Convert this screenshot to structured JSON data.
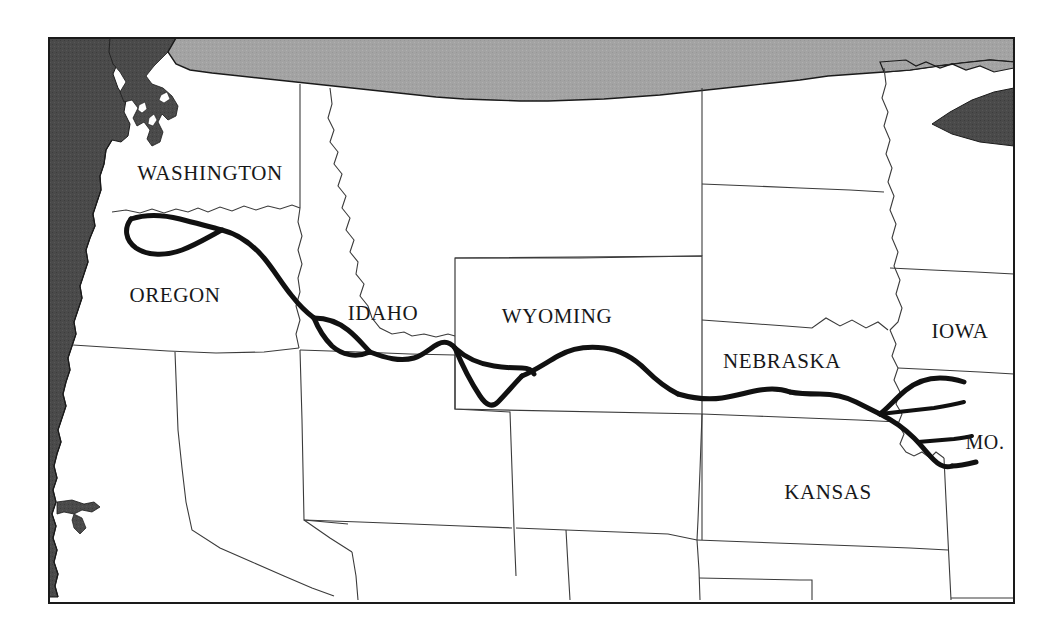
{
  "figure": {
    "kind": "reference-map",
    "background_color": "#ffffff",
    "frame": {
      "border_color": "#1a1a1a",
      "border_width_px": 2,
      "x": 48,
      "y": 37,
      "width": 967,
      "height": 567
    }
  },
  "colors": {
    "land_fill": "#ffffff",
    "ocean_fill": "#4a4a4a",
    "lake_fill": "#4a4a4a",
    "canada_fill": "#a3a3a3",
    "state_border": "#3b3b3b",
    "coastline": "#1a1a1a",
    "trail_stroke": "#111111",
    "label_text": "#17181a"
  },
  "legend_present": false,
  "scale_bar_present": false,
  "compass_present": false,
  "state_labels": [
    {
      "id": "washington",
      "text": "WASHINGTON",
      "x": 210,
      "y": 175
    },
    {
      "id": "oregon",
      "text": "OREGON",
      "x": 175,
      "y": 297
    },
    {
      "id": "idaho",
      "text": "IDAHO",
      "x": 383,
      "y": 315
    },
    {
      "id": "wyoming",
      "text": "WYOMING",
      "x": 557,
      "y": 318
    },
    {
      "id": "nebraska",
      "text": "NEBRASKA",
      "x": 782,
      "y": 363
    },
    {
      "id": "iowa",
      "text": "IOWA",
      "x": 960,
      "y": 333
    },
    {
      "id": "missouri",
      "text": "MO.",
      "x": 985,
      "y": 444
    },
    {
      "id": "kansas",
      "text": "KANSAS",
      "x": 828,
      "y": 494
    }
  ],
  "unlabeled_regions": [
    "Canada",
    "Montana",
    "North Dakota",
    "South Dakota",
    "Minnesota",
    "California",
    "Nevada",
    "Utah",
    "Colorado",
    "Arizona",
    "New Mexico",
    "Oklahoma",
    "Texas panhandle"
  ],
  "trail": {
    "name": "Oregon Trail",
    "stroke_color": "#111111",
    "stroke_width_px": 5,
    "style": "solid thick line",
    "branches": 5,
    "description": "Main route runs from the Missouri River westward across Nebraska, through southern Wyoming, across southern Idaho and into the Willamette Valley of Oregon, with secondary cutoff branches."
  }
}
